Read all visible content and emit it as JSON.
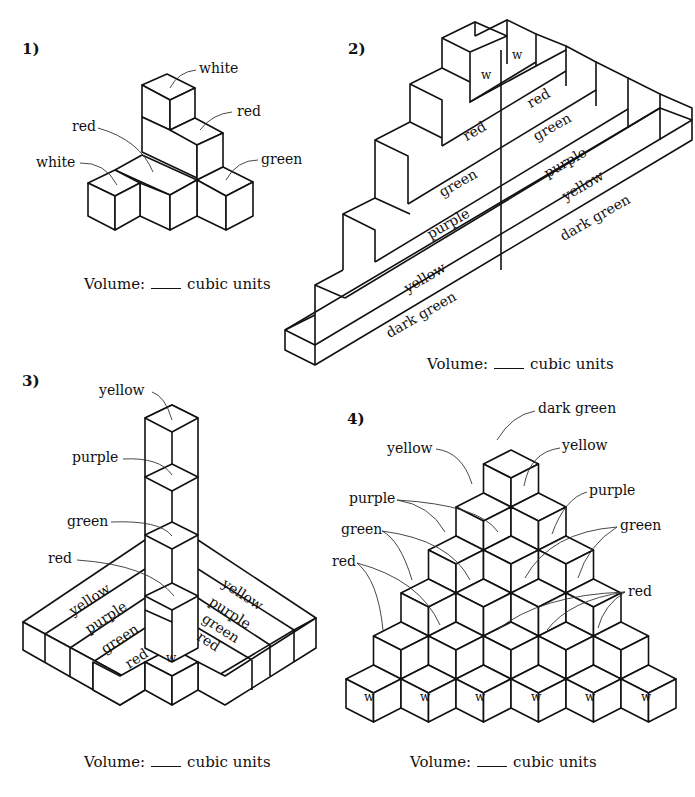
{
  "volume_text": {
    "prefix": "Volume:",
    "suffix": "cubic units"
  },
  "problems": [
    {
      "number": "1)",
      "labels": [
        "white",
        "red",
        "red",
        "white",
        "green"
      ]
    },
    {
      "number": "2)",
      "top_labels": [
        "w",
        "w"
      ],
      "left_rows": [
        "red",
        "green",
        "purple",
        "yellow",
        "dark green"
      ],
      "right_rows": [
        "red",
        "green",
        "purple",
        "yellow",
        "dark green"
      ]
    },
    {
      "number": "3)",
      "tower_labels": [
        "yellow",
        "purple",
        "green",
        "red"
      ],
      "left_rows": [
        "yellow",
        "purple",
        "green",
        "red"
      ],
      "right_rows": [
        "yellow",
        "purple",
        "green",
        "red"
      ],
      "corner_label": "w"
    },
    {
      "number": "4)",
      "labels": {
        "top": "dark green",
        "yellow_left": "yellow",
        "yellow_right": "yellow",
        "purple_left": "purple",
        "purple_right": "purple",
        "green_left": "green",
        "green_right": "green",
        "red_left": "red",
        "red_right": "red"
      },
      "bottom_labels": [
        "w",
        "w",
        "w",
        "w",
        "w",
        "w"
      ]
    }
  ]
}
